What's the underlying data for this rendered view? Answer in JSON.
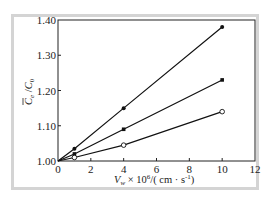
{
  "chart_data": {
    "type": "line",
    "title": "",
    "xlabel": "V_w × 10^6 / (cm · s^-1)",
    "ylabel": "C̄_e / C_0",
    "xlim": [
      0,
      12
    ],
    "ylim": [
      1.0,
      1.4
    ],
    "x_ticks": [
      0,
      2,
      4,
      6,
      8,
      10,
      12
    ],
    "y_ticks": [
      1.0,
      1.1,
      1.2,
      1.3,
      1.4
    ],
    "x_tick_labels": [
      "0",
      "2",
      "4",
      "6",
      "8",
      "10",
      "12"
    ],
    "y_tick_labels": [
      "1.00",
      "1.10",
      "1.20",
      "1.30",
      "1.40"
    ],
    "grid": false,
    "legend": null,
    "series": [
      {
        "name": "series-1 (filled circle)",
        "marker": "filled-circle",
        "x": [
          0,
          1,
          4,
          10
        ],
        "values": [
          1.0,
          1.035,
          1.15,
          1.38
        ]
      },
      {
        "name": "series-2 (filled square)",
        "marker": "filled-square",
        "x": [
          0,
          1,
          4,
          10
        ],
        "values": [
          1.0,
          1.02,
          1.09,
          1.23
        ]
      },
      {
        "name": "series-3 (open circle)",
        "marker": "open-circle",
        "x": [
          0,
          1,
          4,
          10
        ],
        "values": [
          1.0,
          1.01,
          1.045,
          1.14
        ]
      }
    ]
  },
  "labels": {
    "x_axis_main": "V",
    "x_axis_sub": "w",
    "x_axis_rest": " × 10",
    "x_axis_exp": "6",
    "x_axis_units": "/( cm · s",
    "x_axis_units_exp": "-1",
    "x_axis_close": ")",
    "y_axis_num": "C",
    "y_axis_num_sub": "e",
    "y_axis_slash": " /",
    "y_axis_den": "C",
    "y_axis_den_sub": "0"
  },
  "colors": {
    "frame": "#d4d4d4",
    "axis": "#222222",
    "line": "#111111"
  }
}
